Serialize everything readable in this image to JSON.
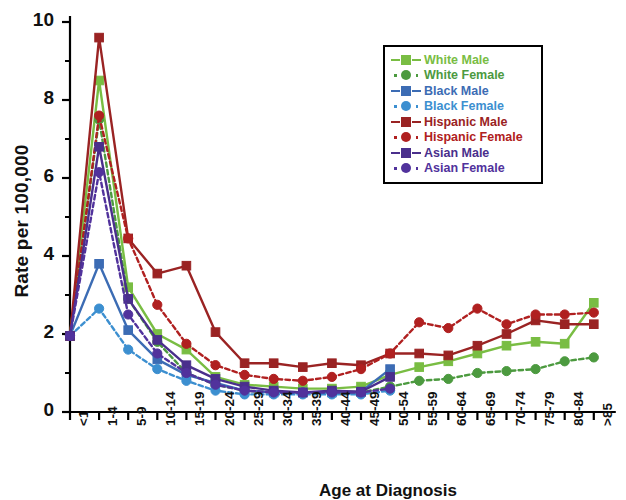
{
  "chart_data": {
    "type": "line",
    "title": "",
    "xlabel": "Age at Diagnosis",
    "ylabel": "Rate per 100,000",
    "ylim": [
      0,
      10
    ],
    "yticks": [
      0,
      2,
      4,
      6,
      8,
      10
    ],
    "yminor": true,
    "grid": false,
    "legend_position": "top-right",
    "categories": [
      "<1",
      "1-4",
      "5-9",
      "10-14",
      "15-19",
      "20-24",
      "25-29",
      "30-34",
      "35-39",
      "40-44",
      "45-49",
      "50-54",
      "55-59",
      "60-64",
      "65-69",
      "70-74",
      "75-79",
      "80-84",
      ">85"
    ],
    "series": [
      {
        "name": "White Male",
        "color": "#79bd43",
        "marker": "square",
        "dash": "solid",
        "values": [
          1.95,
          8.5,
          3.2,
          2.0,
          1.6,
          0.9,
          0.7,
          0.65,
          0.6,
          0.6,
          0.65,
          0.95,
          1.15,
          1.3,
          1.5,
          1.7,
          1.8,
          1.75,
          2.8
        ]
      },
      {
        "name": "White Female",
        "color": "#4c9a3f",
        "marker": "circle",
        "dash": "dotted",
        "values": [
          1.95,
          7.5,
          2.9,
          1.8,
          1.0,
          0.7,
          0.55,
          0.5,
          0.5,
          0.5,
          0.5,
          0.65,
          0.8,
          0.85,
          1.0,
          1.05,
          1.1,
          1.3,
          1.4
        ]
      },
      {
        "name": "Black Male",
        "color": "#3c6cb4",
        "marker": "square",
        "dash": "solid",
        "values": [
          1.95,
          3.8,
          2.1,
          1.35,
          0.95,
          0.75,
          0.55,
          0.5,
          0.5,
          0.5,
          0.52,
          1.1,
          null,
          null,
          null,
          null,
          null,
          null,
          null
        ]
      },
      {
        "name": "Black Female",
        "color": "#3c8fd0",
        "marker": "circle",
        "dash": "dotted",
        "values": [
          1.95,
          2.65,
          1.6,
          1.1,
          0.8,
          0.55,
          0.45,
          0.45,
          0.45,
          0.45,
          0.45,
          0.55,
          null,
          null,
          null,
          null,
          null,
          null,
          null
        ]
      },
      {
        "name": "Hispanic Male",
        "color": "#9a2323",
        "marker": "square",
        "dash": "solid",
        "values": [
          1.95,
          9.6,
          4.45,
          3.55,
          3.75,
          2.05,
          1.25,
          1.25,
          1.15,
          1.25,
          1.2,
          1.5,
          1.5,
          1.45,
          1.7,
          2.0,
          2.35,
          2.25,
          2.25
        ]
      },
      {
        "name": "Hispanic Female",
        "color": "#b02020",
        "marker": "circle",
        "dash": "dotted",
        "values": [
          1.95,
          7.6,
          4.45,
          2.75,
          1.75,
          1.2,
          0.95,
          0.85,
          0.8,
          0.9,
          1.1,
          1.5,
          2.3,
          2.15,
          2.65,
          2.25,
          2.5,
          2.5,
          2.55
        ]
      },
      {
        "name": "Asian Male",
        "color": "#4a2f8c",
        "marker": "square",
        "dash": "solid",
        "values": [
          1.95,
          6.8,
          2.9,
          1.85,
          1.2,
          0.85,
          0.65,
          0.55,
          0.5,
          0.55,
          0.52,
          0.9,
          null,
          null,
          null,
          null,
          null,
          null,
          null
        ]
      },
      {
        "name": "Asian Female",
        "color": "#51329c",
        "marker": "circle",
        "dash": "dotted",
        "values": [
          1.95,
          6.15,
          2.5,
          1.5,
          1.0,
          0.7,
          0.55,
          0.5,
          0.5,
          0.5,
          0.5,
          0.6,
          null,
          null,
          null,
          null,
          null,
          null,
          null
        ]
      }
    ]
  },
  "axes": {
    "y_title": "Rate per 100,000",
    "x_title": "Age at Diagnosis"
  }
}
